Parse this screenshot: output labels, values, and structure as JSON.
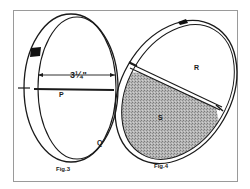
{
  "figures": [
    {
      "caption": "Fig.3",
      "dimension_label": "3¼\"",
      "labels": {
        "rod": "P",
        "ring": "Q"
      }
    },
    {
      "caption": "Fig.4",
      "labels": {
        "upper_region": "R",
        "lower_region": "S"
      }
    }
  ],
  "colors": {
    "ink": "#1a1a1a",
    "frame": "#9a9a9a",
    "shading": "#a8a8a8",
    "background": "#ffffff"
  }
}
